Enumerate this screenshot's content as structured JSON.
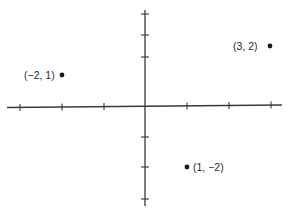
{
  "diagram": {
    "type": "coordinate-plane",
    "origin_px": [
      145,
      106
    ],
    "unit_px": [
      42,
      30.5
    ],
    "x_axis": {
      "from": -3,
      "to": 3,
      "ticks": [
        -3,
        -2,
        -1,
        1,
        2,
        3
      ]
    },
    "y_axis": {
      "from": -3,
      "to": 3,
      "ticks": [
        -3,
        -2,
        -1,
        1,
        2,
        3
      ]
    },
    "colors": {
      "axis": "#3a3a3a",
      "point": "#1a1a1a",
      "label": "#2a2a2a"
    }
  },
  "points": [
    {
      "x": -2,
      "y": 1,
      "label": "(−2, 1)",
      "label_side": "left"
    },
    {
      "x": 3,
      "y": 2,
      "label": "(3, 2)",
      "label_side": "left"
    },
    {
      "x": 1,
      "y": -2,
      "label": "(1, −2)",
      "label_side": "right"
    }
  ]
}
